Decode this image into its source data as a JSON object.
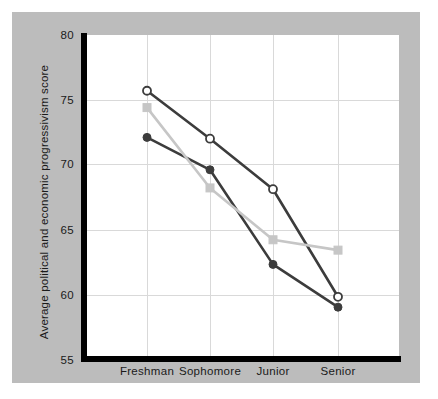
{
  "chart_data": {
    "type": "line",
    "title": "",
    "xlabel": "",
    "ylabel": "Average political and economic progressivism score",
    "categories": [
      "Freshman",
      "Sophomore",
      "Junior",
      "Senior"
    ],
    "ylim": [
      55,
      80
    ],
    "yticks": [
      55,
      60,
      65,
      70,
      75,
      80
    ],
    "ytick_labels": [
      "55",
      "60",
      "65",
      "70",
      "75",
      "80"
    ],
    "grid": true,
    "legend": "none",
    "series": [
      {
        "name": "series-open-circle-dark",
        "marker": "open-circle",
        "color": "#3c3c3c",
        "values": [
          75.7,
          72.0,
          68.1,
          59.8
        ]
      },
      {
        "name": "series-filled-circle-dark",
        "marker": "filled-circle",
        "color": "#3c3c3c",
        "values": [
          72.1,
          69.6,
          62.3,
          59.0
        ]
      },
      {
        "name": "series-filled-square-light",
        "marker": "filled-square",
        "color": "#c6c6c6",
        "values": [
          74.4,
          68.2,
          64.2,
          63.4
        ]
      }
    ]
  },
  "axis": {
    "y": {
      "label": "Average political and economic progressivism score",
      "ticks": [
        {
          "value": "80"
        },
        {
          "value": "75"
        },
        {
          "value": "70"
        },
        {
          "value": "65"
        },
        {
          "value": "60"
        },
        {
          "value": "55"
        }
      ]
    },
    "x": {
      "ticks": [
        {
          "value": "Freshman"
        },
        {
          "value": "Sophomore"
        },
        {
          "value": "Junior"
        },
        {
          "value": "Senior"
        }
      ]
    }
  },
  "colors": {
    "panel_background": "#bcbcbc",
    "plot_background": "#ffffff",
    "axis": "#000000",
    "gridline": "#d9d9d9",
    "series_dark": "#3c3c3c",
    "series_light": "#c6c6c6"
  }
}
